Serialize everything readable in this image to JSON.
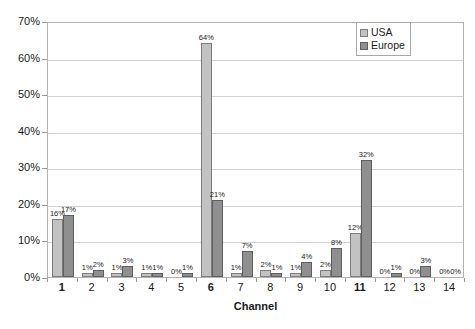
{
  "chart_data": {
    "type": "bar",
    "title": "",
    "xlabel": "Channel",
    "ylabel": "",
    "categories": [
      "1",
      "2",
      "3",
      "4",
      "5",
      "6",
      "7",
      "8",
      "9",
      "10",
      "11",
      "12",
      "13",
      "14"
    ],
    "bold_categories": [
      "1",
      "6",
      "11"
    ],
    "series": [
      {
        "name": "USA",
        "color": "#c2c2c2",
        "values": [
          16,
          1,
          1,
          1,
          0,
          64,
          1,
          2,
          1,
          2,
          12,
          0,
          0,
          0
        ],
        "labels": [
          "16%",
          "1%",
          "1%",
          "1%",
          "0%",
          "64%",
          "1%",
          "2%",
          "1%",
          "2%",
          "12%",
          "0%",
          "0%",
          "0%"
        ]
      },
      {
        "name": "Europe",
        "color": "#8f8f8f",
        "values": [
          17,
          2,
          3,
          1,
          1,
          21,
          7,
          1,
          4,
          8,
          32,
          1,
          3,
          0
        ],
        "labels": [
          "17%",
          "2%",
          "3%",
          "1%",
          "1%",
          "21%",
          "7%",
          "1%",
          "4%",
          "8%",
          "32%",
          "1%",
          "3%",
          "0%"
        ]
      }
    ],
    "ylim": [
      0,
      70
    ],
    "ytick_values": [
      0,
      10,
      20,
      30,
      40,
      50,
      60,
      70
    ],
    "ytick_labels": [
      "0%",
      "10%",
      "20%",
      "30%",
      "40%",
      "50%",
      "60%",
      "70%"
    ],
    "grid": true,
    "legend_position": "top-right",
    "value_suffix": "%"
  },
  "legend": {
    "items": [
      {
        "label": "USA"
      },
      {
        "label": "Europe"
      }
    ]
  },
  "axis": {
    "x_title": "Channel"
  }
}
